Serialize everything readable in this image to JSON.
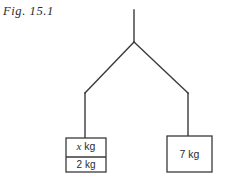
{
  "figure": {
    "caption": "Fig. 15.1",
    "background_color": "#ffffff",
    "line_color": "#3a3a3a",
    "text_color": "#2b2b2b"
  },
  "diagram": {
    "type": "mechanics-free-body-diagram",
    "support": {
      "name": "vertical-support-string",
      "from": [
        134,
        10
      ],
      "to": [
        134,
        42
      ]
    },
    "junction": {
      "name": "string-junction-point",
      "point": [
        134,
        42
      ]
    },
    "strings": [
      {
        "name": "left-diagonal-string",
        "from": [
          134,
          42
        ],
        "to": [
          85,
          93
        ]
      },
      {
        "name": "left-vertical-string",
        "from": [
          85,
          93
        ],
        "to": [
          85,
          138
        ]
      },
      {
        "name": "right-diagonal-string",
        "from": [
          134,
          42
        ],
        "to": [
          188,
          93
        ]
      },
      {
        "name": "right-vertical-string",
        "from": [
          188,
          93
        ],
        "to": [
          188,
          136
        ]
      }
    ],
    "blocks": [
      {
        "name": "left-block",
        "x": 66,
        "y": 138,
        "width": 40,
        "height": 34,
        "divider_y": 157,
        "compartments": [
          {
            "name": "upper-mass",
            "label_symbol": "x",
            "label_unit": "kg",
            "label": "x kg"
          },
          {
            "name": "lower-mass",
            "label_symbol": "2",
            "label_unit": "kg",
            "label": "2 kg"
          }
        ]
      },
      {
        "name": "right-block",
        "x": 167,
        "y": 136,
        "width": 45,
        "height": 36,
        "compartments": [
          {
            "name": "single-mass",
            "label_symbol": "7",
            "label_unit": "kg",
            "label": "7 kg"
          }
        ]
      }
    ]
  },
  "labels": {
    "left_upper": {
      "symbol": "x",
      "unit": " kg"
    },
    "left_lower": "2 kg",
    "right": "7 kg"
  }
}
